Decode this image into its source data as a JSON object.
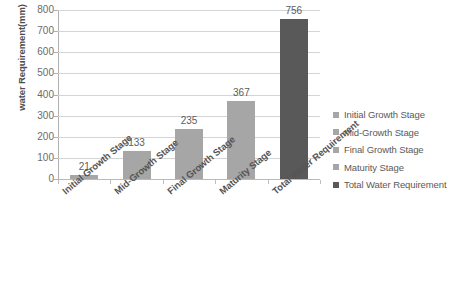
{
  "chart_data": {
    "type": "bar",
    "title": "",
    "xlabel": "",
    "ylabel": "water Requirement(mm)",
    "categories": [
      "Initial Growth Stage",
      "Mid-Growth Stage",
      "Final Growth Stage",
      "Maturity Stage",
      "Total Water Requirement"
    ],
    "values": [
      21,
      133,
      235,
      367,
      756
    ],
    "value_labels": [
      "21",
      "133",
      "235",
      "367",
      "756"
    ],
    "ylim": [
      0,
      800
    ],
    "ytick_labels": [
      "800",
      "700",
      "600",
      "500",
      "400",
      "300",
      "200",
      "100",
      "0"
    ],
    "ytick_values": [
      800,
      700,
      600,
      500,
      400,
      300,
      200,
      100,
      0
    ],
    "grid": true,
    "legend_position": "right",
    "legend": [
      {
        "label": "Initial Growth Stage",
        "color": "#a6a6a6"
      },
      {
        "label": "Mid-Growth Stage",
        "color": "#a6a6a6"
      },
      {
        "label": "Final Growth Stage",
        "color": "#a6a6a6"
      },
      {
        "label": "Maturity Stage",
        "color": "#a6a6a6"
      },
      {
        "label": "Total Water Requirement",
        "color": "#595959"
      }
    ],
    "bar_colors": [
      "#a6a6a6",
      "#a6a6a6",
      "#a6a6a6",
      "#a6a6a6",
      "#595959"
    ],
    "background_color": "#ffffff",
    "gridline_color": "#d4d4d4"
  }
}
